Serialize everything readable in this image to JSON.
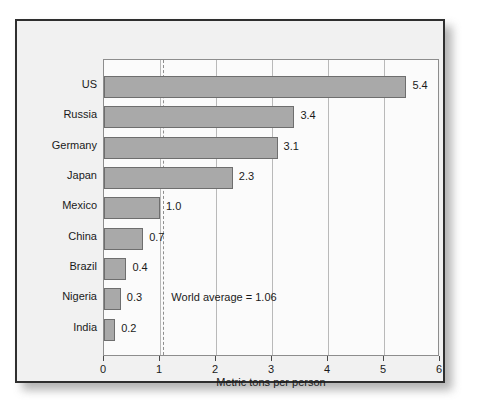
{
  "chart_data": {
    "type": "bar",
    "orientation": "horizontal",
    "title": "",
    "xlabel": "Metric tons per person",
    "ylabel": "",
    "xlim": [
      0,
      6
    ],
    "xticks": [
      "0",
      "1",
      "2",
      "3",
      "4",
      "5",
      "6"
    ],
    "grid": true,
    "legend": null,
    "categories": [
      "US",
      "Russia",
      "Germany",
      "Japan",
      "Mexico",
      "China",
      "Brazil",
      "Nigeria",
      "India"
    ],
    "values": [
      5.4,
      3.4,
      3.1,
      2.3,
      1.0,
      0.7,
      0.4,
      0.3,
      0.2
    ],
    "value_labels": [
      "5.4",
      "3.4",
      "3.1",
      "2.3",
      "1.0",
      "0.7",
      "0.4",
      "0.3",
      "0.2"
    ],
    "annotations": [
      {
        "text": "World average = 1.06",
        "value": 1.06,
        "kind": "reference-line-label"
      }
    ],
    "reference_line": {
      "value": 1.06,
      "style": "dashed",
      "color": "#8f8f8f"
    },
    "colors": {
      "bar_fill": "#a9a9a9",
      "bar_edge": "#6e6e6e",
      "plot_background": "#fbfbfb",
      "panel_background": "#f1f1f1",
      "frame": "#2f2f2f",
      "gridline": "#b9b9b9",
      "text": "#1a1a1a"
    }
  }
}
